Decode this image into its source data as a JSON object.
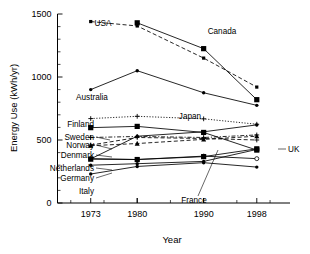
{
  "chart_data": {
    "type": "line",
    "title": "",
    "xlabel": "Year",
    "ylabel": "Energy Use (kWh/yr)",
    "x": [
      1973,
      1980,
      1990,
      1998
    ],
    "xtick_labels": [
      "1973",
      "1980",
      "1990",
      "1998"
    ],
    "ytick_labels": [
      "0",
      "500",
      "1000",
      "1500"
    ],
    "ytick_values": [
      0,
      500,
      1000,
      1500
    ],
    "ylim": [
      0,
      1500
    ],
    "xlim": [
      1968,
      2003
    ],
    "yminor_step": 100,
    "grid": false,
    "legend": "inline-labels",
    "series": [
      {
        "name": "USA",
        "label": "USA",
        "style": "dashed",
        "marker": "small-square",
        "x": [
          1973,
          1980,
          1990,
          1998
        ],
        "values": [
          1440,
          1405,
          1150,
          920
        ]
      },
      {
        "name": "Canada",
        "label": "Canada",
        "style": "solid",
        "marker": "square",
        "x": [
          1980,
          1990,
          1998
        ],
        "values": [
          1430,
          1225,
          820
        ]
      },
      {
        "name": "Australia",
        "label": "Australia",
        "style": "solid",
        "marker": "dot",
        "x": [
          1973,
          1980,
          1990,
          1998
        ],
        "values": [
          900,
          1050,
          875,
          775
        ]
      },
      {
        "name": "Finland",
        "label": "Finland",
        "style": "dotted",
        "marker": "cross",
        "x": [
          1973,
          1980,
          1990,
          1998
        ],
        "values": [
          670,
          688,
          668,
          625
        ]
      },
      {
        "name": "Japan",
        "label": "Japan",
        "style": "solid",
        "marker": "dot",
        "x": [
          1973,
          1980,
          1990,
          1998
        ],
        "values": [
          350,
          530,
          565,
          620
        ]
      },
      {
        "name": "Sweden",
        "label": "Sweden",
        "style": "solid",
        "marker": "square",
        "x": [
          1973,
          1980,
          1990,
          1998
        ],
        "values": [
          598,
          608,
          560,
          420
        ]
      },
      {
        "name": "Norway",
        "label": "Norway",
        "style": "dash-dot",
        "marker": "cross",
        "x": [
          1973,
          1980,
          1990,
          1998
        ],
        "values": [
          520,
          528,
          520,
          540
        ]
      },
      {
        "name": "Denmark",
        "label": "Denmark",
        "style": "dashed",
        "marker": "triangle",
        "x": [
          1973,
          1980,
          1990,
          1998
        ],
        "values": [
          455,
          472,
          505,
          530
        ]
      },
      {
        "name": "UK",
        "label": "UK",
        "style": "dashed",
        "marker": "cross",
        "x": [
          1973,
          1980,
          1990,
          1998
        ],
        "values": [
          460,
          520,
          512,
          500
        ]
      },
      {
        "name": "Netherlands",
        "label": "Netherlands",
        "style": "solid",
        "marker": "open-circle",
        "x": [
          1973,
          1980,
          1990,
          1998
        ],
        "values": [
          352,
          345,
          372,
          352
        ]
      },
      {
        "name": "Germany",
        "label": "Germany",
        "style": "solid",
        "marker": "square",
        "x": [
          1973,
          1980,
          1990,
          1998
        ],
        "values": [
          348,
          345,
          368,
          430
        ]
      },
      {
        "name": "France",
        "label": "France",
        "style": "solid",
        "marker": "dot",
        "x": [
          1973,
          1980,
          1990,
          1998
        ],
        "values": [
          300,
          312,
          330,
          425
        ]
      },
      {
        "name": "Italy",
        "label": "Italy",
        "style": "solid",
        "marker": "dot",
        "x": [
          1973,
          1980,
          1990,
          1998
        ],
        "values": [
          230,
          290,
          320,
          285
        ]
      }
    ],
    "annotations": [
      {
        "name": "USA",
        "text": "USA"
      },
      {
        "name": "Canada",
        "text": "Canada"
      },
      {
        "name": "Australia",
        "text": "Australia"
      },
      {
        "name": "Finland",
        "text": "Finland"
      },
      {
        "name": "Japan",
        "text": "Japan"
      },
      {
        "name": "Sweden",
        "text": "Sweden"
      },
      {
        "name": "Norway",
        "text": "Norway"
      },
      {
        "name": "Denmark",
        "text": "Denmark"
      },
      {
        "name": "Netherlands",
        "text": "Netherlands"
      },
      {
        "name": "Germany",
        "text": "Germany"
      },
      {
        "name": "Italy",
        "text": "Italy"
      },
      {
        "name": "France",
        "text": "France"
      },
      {
        "name": "UK",
        "text": "UK"
      }
    ],
    "colors": {
      "line": "#000000",
      "text": "#000000",
      "background": "#ffffff"
    }
  }
}
